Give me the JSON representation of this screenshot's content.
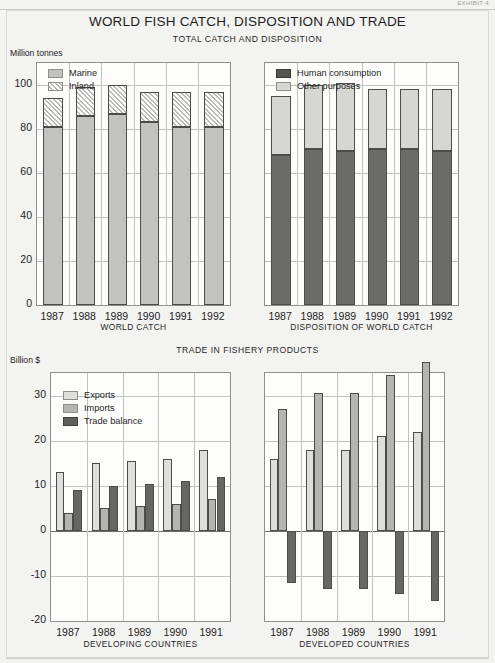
{
  "exhibit": {
    "tag": "EXHIBIT 4"
  },
  "titles": {
    "main": "WORLD FISH CATCH, DISPOSITION AND TRADE",
    "section_top": "TOTAL CATCH AND DISPOSITION",
    "section_bottom": "TRADE IN FISHERY PRODUCTS"
  },
  "units": {
    "top": "Million tonnes",
    "bottom": "Billion $"
  },
  "chart_data": [
    {
      "id": "world-catch",
      "type": "bar",
      "stacked": true,
      "title": "WORLD CATCH",
      "xlabel": "",
      "ylabel": "Million tonnes",
      "ylim": [
        0,
        110
      ],
      "yticks": [
        0,
        20,
        40,
        60,
        80,
        100
      ],
      "grid": true,
      "legend_position": "top-left",
      "categories": [
        "1987",
        "1988",
        "1989",
        "1990",
        "1991",
        "1992"
      ],
      "series": [
        {
          "name": "Marine",
          "values": [
            81,
            86,
            87,
            83,
            81,
            81
          ],
          "color": "#c2c2c0",
          "pattern": "solid"
        },
        {
          "name": "Inland",
          "values": [
            13,
            13,
            13,
            14,
            16,
            16
          ],
          "color": "#b9b9b6",
          "pattern": "hatched"
        }
      ],
      "totals": [
        94,
        99,
        100,
        97,
        97,
        97
      ]
    },
    {
      "id": "disposition-of-world-catch",
      "type": "bar",
      "stacked": true,
      "title": "DISPOSITION OF WORLD CATCH",
      "xlabel": "",
      "ylabel": "Million tonnes",
      "ylim": [
        0,
        110
      ],
      "yticks": [
        0,
        20,
        40,
        60,
        80,
        100
      ],
      "grid": true,
      "legend_position": "top-left",
      "categories": [
        "1987",
        "1988",
        "1989",
        "1990",
        "1991",
        "1992"
      ],
      "series": [
        {
          "name": "Human consumption",
          "values": [
            68,
            71,
            70,
            71,
            71,
            70
          ],
          "color": "#6b6b68",
          "pattern": "solid"
        },
        {
          "name": "Other purposes",
          "values": [
            27,
            29,
            31,
            27,
            27,
            28
          ],
          "color": "#d6d6d3",
          "pattern": "solid"
        }
      ],
      "totals": [
        95,
        100,
        101,
        98,
        98,
        98
      ]
    },
    {
      "id": "trade-developing-countries",
      "type": "bar",
      "stacked": false,
      "title": "DEVELOPING COUNTRIES",
      "xlabel": "",
      "ylabel": "Billion $",
      "ylim": [
        -20,
        35
      ],
      "yticks": [
        30,
        20,
        10,
        0,
        -10,
        -20
      ],
      "grid": true,
      "legend_position": "top-left",
      "categories": [
        "1987",
        "1988",
        "1989",
        "1990",
        "1991"
      ],
      "series": [
        {
          "name": "Exports",
          "values": [
            13.0,
            15.0,
            15.5,
            16.0,
            18.0
          ],
          "color": "#dededb"
        },
        {
          "name": "Imports",
          "values": [
            4.0,
            5.0,
            5.5,
            6.0,
            7.0
          ],
          "color": "#b4b4b1"
        },
        {
          "name": "Trade balance",
          "values": [
            9.0,
            10.0,
            10.5,
            11.0,
            12.0
          ],
          "color": "#666663"
        }
      ]
    },
    {
      "id": "trade-developed-countries",
      "type": "bar",
      "stacked": false,
      "title": "DEVELOPED COUNTRIES",
      "xlabel": "",
      "ylabel": "Billion $",
      "ylim": [
        -20,
        35
      ],
      "yticks": [
        30,
        20,
        10,
        0,
        -10,
        -20
      ],
      "grid": true,
      "legend_position": "top-left",
      "categories": [
        "1987",
        "1988",
        "1989",
        "1990",
        "1991"
      ],
      "series": [
        {
          "name": "Exports",
          "values": [
            16.0,
            18.0,
            18.0,
            21.0,
            22.0
          ],
          "color": "#dededb"
        },
        {
          "name": "Imports",
          "values": [
            27.0,
            30.5,
            30.5,
            34.5,
            37.5
          ],
          "color": "#b4b4b1"
        },
        {
          "name": "Trade balance",
          "values": [
            -11.5,
            -13.0,
            -13.0,
            -14.0,
            -15.5
          ],
          "color": "#666663"
        }
      ]
    }
  ]
}
